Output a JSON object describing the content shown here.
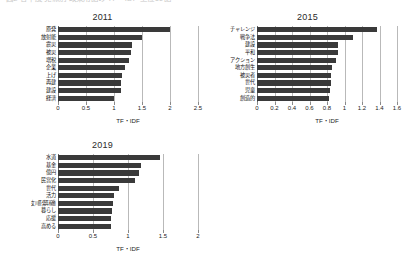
{
  "caption": {
    "text": "図2 各年度 党派別 政策用語の TF・IDF 上位10語"
  },
  "axis_title": "TF・IDF",
  "colors": {
    "bar": "#3a3a3a",
    "grid": "#b9b9b9",
    "axis": "#6a6a6a",
    "text": "#1a1a1a",
    "background": "#ffffff"
  },
  "chart_data": [
    {
      "type": "bar",
      "title": "2011",
      "orientation": "horizontal",
      "xlabel": "TF・IDF",
      "ylabel": "",
      "xlim": [
        0,
        2.5
      ],
      "grid": true,
      "legend": "none",
      "xticks": [
        "0",
        "0.5",
        "1",
        "1.5",
        "2",
        "2.5"
      ],
      "xtickvalues": [
        0,
        0.5,
        1,
        1.5,
        2,
        2.5
      ],
      "categories": [
        "原発",
        "放射能",
        "震災",
        "被災",
        "増税",
        "企業",
        "上げ",
        "再建",
        "建設",
        "経済"
      ],
      "values": [
        2.0,
        1.5,
        1.32,
        1.3,
        1.27,
        1.2,
        1.15,
        1.13,
        1.12,
        1.0
      ]
    },
    {
      "type": "bar",
      "title": "2015",
      "orientation": "horizontal",
      "xlabel": "TF・IDF",
      "ylabel": "",
      "xlim": [
        0,
        1.6
      ],
      "grid": true,
      "legend": "none",
      "xticks": [
        "0",
        "0.2",
        "0.4",
        "0.6",
        "0.8",
        "1",
        "1.2",
        "1.4",
        "1.6"
      ],
      "xtickvalues": [
        0,
        0.2,
        0.4,
        0.6,
        0.8,
        1.0,
        1.2,
        1.4,
        1.6
      ],
      "categories": [
        "チャレンジ",
        "戦争法",
        "建設",
        "平和",
        "アクション",
        "地方創生",
        "被災者",
        "世代",
        "児童",
        "創造的"
      ],
      "values": [
        1.37,
        1.1,
        0.93,
        0.92,
        0.9,
        0.86,
        0.85,
        0.84,
        0.83,
        0.82
      ]
    },
    {
      "type": "bar",
      "title": "2019",
      "orientation": "horizontal",
      "xlabel": "TF・IDF",
      "ylabel": "",
      "xlim": [
        0,
        2.0
      ],
      "grid": true,
      "legend": "none",
      "xticks": [
        "0",
        "0.5",
        "1",
        "1.5",
        "2"
      ],
      "xtickvalues": [
        0,
        0.5,
        1.0,
        1.5,
        2.0
      ],
      "categories": [
        "水道",
        "基金",
        "億円",
        "民営化",
        "世代",
        "活力",
        "女川原発再稼働",
        "暮らし",
        "応援",
        "高める"
      ],
      "values": [
        1.46,
        1.19,
        1.16,
        1.1,
        0.87,
        0.8,
        0.78,
        0.77,
        0.76,
        0.75
      ]
    }
  ]
}
